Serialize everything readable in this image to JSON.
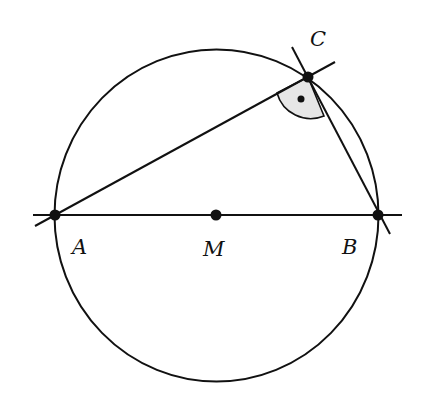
{
  "diagram": {
    "points": {
      "A": {
        "label": "A"
      },
      "B": {
        "label": "B"
      },
      "M": {
        "label": "M"
      },
      "C": {
        "label": "C"
      }
    },
    "right_angle_marker_color": "#e6e6e6",
    "stroke_color": "#111111"
  }
}
